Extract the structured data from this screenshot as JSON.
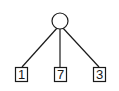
{
  "diagram": {
    "type": "tree",
    "root": {
      "shape": "circle",
      "label": ""
    },
    "leaves": [
      {
        "label": "1"
      },
      {
        "label": "7"
      },
      {
        "label": "3"
      }
    ],
    "colors": {
      "stroke": "#1a1a1a",
      "fill": "#ffffff"
    }
  }
}
